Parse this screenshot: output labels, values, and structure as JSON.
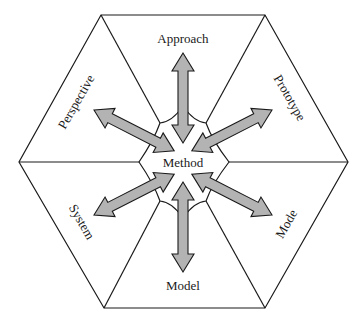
{
  "diagram": {
    "center_label": "Method",
    "segments": [
      {
        "label": "Approach",
        "position": "top"
      },
      {
        "label": "Prototype",
        "position": "upper-right"
      },
      {
        "label": "Mode",
        "position": "lower-right"
      },
      {
        "label": "Model",
        "position": "bottom"
      },
      {
        "label": "System",
        "position": "lower-left"
      },
      {
        "label": "Perspective",
        "position": "upper-left"
      }
    ],
    "colors": {
      "line": "#1a1a1a",
      "arrow_fill": "#b3b3b3",
      "background": "#ffffff"
    }
  }
}
